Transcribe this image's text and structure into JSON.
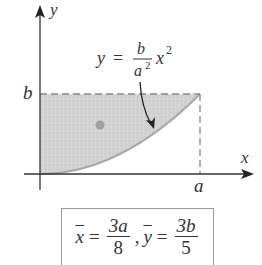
{
  "diagram": {
    "axes": {
      "x_label": "x",
      "y_label": "y"
    },
    "tick_labels": {
      "x_end": "a",
      "y_top": "b"
    },
    "curve_equation": {
      "lhs": "y",
      "eq": "=",
      "num": "b",
      "den": "a",
      "den_exp": "2",
      "var": "x",
      "var_exp": "2"
    },
    "region": {
      "description": "Shaded region between y = b and the parabola y = (b/a²)x² for 0 ≤ x ≤ a",
      "fill": "#d4d4d4",
      "curve_color": "#a8a8a8"
    },
    "centroid_dot_color": "#a0a0a0"
  },
  "formula": {
    "xbar": "x",
    "eq1": "=",
    "xnum": "3a",
    "xden": "8",
    "comma": ",",
    "ybar": "y",
    "eq2": "=",
    "ynum": "3b",
    "yden": "5"
  }
}
